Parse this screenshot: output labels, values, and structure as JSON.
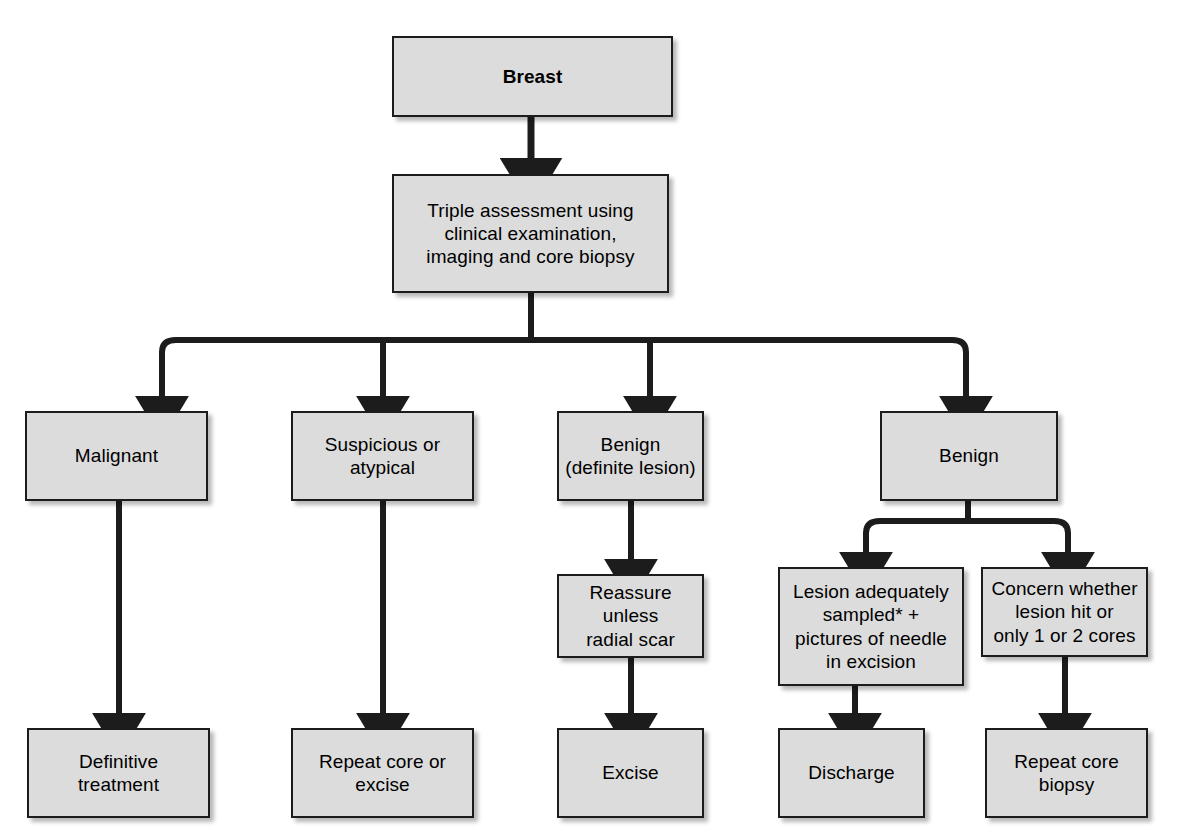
{
  "diagram": {
    "colors": {
      "node_fill": "#dcdcdc",
      "node_border": "#1c1c1c",
      "edge": "#1c1c1c",
      "background": "#ffffff"
    },
    "nodes": [
      {
        "id": "breast",
        "label": "Breast",
        "bold": true,
        "x": 392,
        "y": 36,
        "w": 281,
        "h": 81
      },
      {
        "id": "triple-assessment",
        "label": "Triple assessment using\nclinical examination,\nimaging and core biopsy",
        "bold": false,
        "x": 392,
        "y": 174,
        "w": 277,
        "h": 119
      },
      {
        "id": "malignant",
        "label": "Malignant",
        "bold": false,
        "x": 25,
        "y": 411,
        "w": 183,
        "h": 90
      },
      {
        "id": "suspicious-or-atypical",
        "label": "Suspicious or\natypical",
        "bold": false,
        "x": 291,
        "y": 411,
        "w": 183,
        "h": 90
      },
      {
        "id": "benign-definite-lesion",
        "label": "Benign\n(definite lesion)",
        "bold": false,
        "x": 557,
        "y": 411,
        "w": 147,
        "h": 90
      },
      {
        "id": "benign",
        "label": "Benign",
        "bold": false,
        "x": 880,
        "y": 411,
        "w": 178,
        "h": 90
      },
      {
        "id": "reassure-unless-radial-scar",
        "label": "Reassure unless\nradial scar",
        "bold": false,
        "x": 557,
        "y": 574,
        "w": 147,
        "h": 84
      },
      {
        "id": "lesion-adequately-sampled",
        "label": "Lesion adequately\nsampled* +\npictures of needle\nin excision",
        "bold": false,
        "x": 778,
        "y": 567,
        "w": 186,
        "h": 119
      },
      {
        "id": "concern-whether-lesion-hit",
        "label": "Concern whether\nlesion hit or\nonly 1 or 2 cores",
        "bold": false,
        "x": 981,
        "y": 567,
        "w": 167,
        "h": 90
      },
      {
        "id": "definitive-treatment",
        "label": "Definitive\ntreatment",
        "bold": false,
        "x": 27,
        "y": 728,
        "w": 183,
        "h": 90
      },
      {
        "id": "repeat-core-or-excise",
        "label": "Repeat core or\nexcise",
        "bold": false,
        "x": 291,
        "y": 728,
        "w": 183,
        "h": 90
      },
      {
        "id": "excise",
        "label": "Excise",
        "bold": false,
        "x": 557,
        "y": 728,
        "w": 147,
        "h": 90
      },
      {
        "id": "discharge",
        "label": "Discharge",
        "bold": false,
        "x": 778,
        "y": 728,
        "w": 147,
        "h": 90
      },
      {
        "id": "repeat-core-biopsy",
        "label": "Repeat core\nbiopsy",
        "bold": false,
        "x": 985,
        "y": 728,
        "w": 163,
        "h": 90
      }
    ],
    "edges": [
      {
        "id": "breast-to-triple-assessment",
        "from": "breast",
        "to": "triple-assessment"
      },
      {
        "id": "triple-assessment-to-malignant",
        "from": "triple-assessment",
        "to": "malignant"
      },
      {
        "id": "triple-assessment-to-suspicious",
        "from": "triple-assessment",
        "to": "suspicious-or-atypical"
      },
      {
        "id": "triple-assessment-to-benign-definite",
        "from": "triple-assessment",
        "to": "benign-definite-lesion"
      },
      {
        "id": "triple-assessment-to-benign",
        "from": "triple-assessment",
        "to": "benign"
      },
      {
        "id": "malignant-to-definitive-treatment",
        "from": "malignant",
        "to": "definitive-treatment"
      },
      {
        "id": "suspicious-to-repeat-core-or-excise",
        "from": "suspicious-or-atypical",
        "to": "repeat-core-or-excise"
      },
      {
        "id": "benign-definite-to-reassure",
        "from": "benign-definite-lesion",
        "to": "reassure-unless-radial-scar"
      },
      {
        "id": "reassure-to-excise",
        "from": "reassure-unless-radial-scar",
        "to": "excise"
      },
      {
        "id": "benign-to-lesion-adequately-sampled",
        "from": "benign",
        "to": "lesion-adequately-sampled"
      },
      {
        "id": "benign-to-concern-whether-lesion-hit",
        "from": "benign",
        "to": "concern-whether-lesion-hit"
      },
      {
        "id": "lesion-adequately-sampled-to-discharge",
        "from": "lesion-adequately-sampled",
        "to": "discharge"
      },
      {
        "id": "concern-to-repeat-core-biopsy",
        "from": "concern-whether-lesion-hit",
        "to": "repeat-core-biopsy"
      }
    ]
  }
}
